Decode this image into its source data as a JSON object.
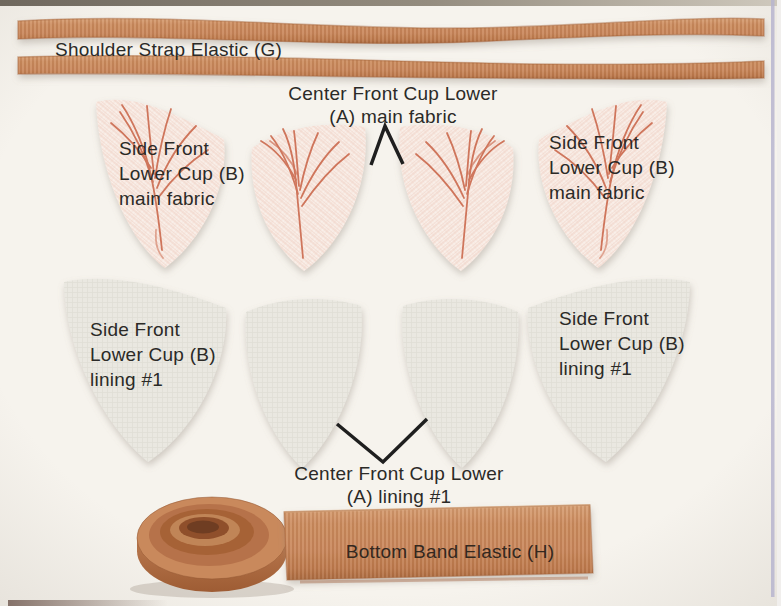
{
  "palette": {
    "background": "#f6f3ed",
    "elastic_terracotta": "#c8875c",
    "elastic_edge": "#a5643a",
    "main_fabric_base": "#f9efe9",
    "main_fabric_vein": "#cb6a4e",
    "lining_fabric": "#eae8e1",
    "label_text": "#2b2a27",
    "page_edge_line": "#b7b5cf"
  },
  "labels": {
    "shoulder_strap": "Shoulder Strap Elastic (G)",
    "center_front_main": "Center Front Cup Lower\n(A) main fabric",
    "side_front_main_left": "Side Front\nLower Cup (B)\nmain fabric",
    "side_front_main_right": "Side Front\nLower Cup (B)\nmain fabric",
    "side_front_lining_left": "Side Front\nLower Cup (B)\nlining #1",
    "side_front_lining_right": "Side Front\nLower Cup (B)\nlining #1",
    "center_front_lining": "Center Front Cup Lower\n(A) lining #1",
    "bottom_band": "Bottom Band Elastic (H)"
  }
}
